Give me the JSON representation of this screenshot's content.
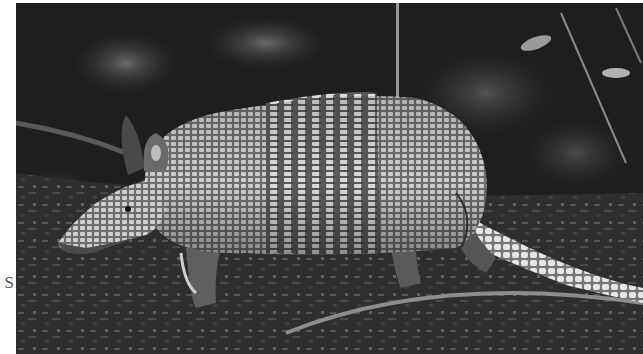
{
  "page": {
    "margin_text": "S"
  },
  "photo": {
    "subject": "nine-banded armadillo",
    "description": "Grayscale photograph of an armadillo walking left across leaf litter with dark foliage background",
    "tone": "grayscale",
    "colors": {
      "background_dark": "#1c1c1c",
      "shell_light": "#c8c8c8",
      "shell_mid": "#8a8a8a",
      "ground": "#3a3a3a",
      "page_bg": "#ffffff"
    }
  }
}
